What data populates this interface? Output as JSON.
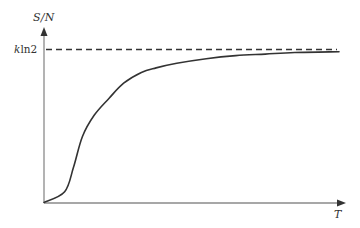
{
  "chart_data": {
    "type": "line",
    "title": "",
    "xlabel": "T",
    "ylabel": "S/N",
    "grid": false,
    "legend": null,
    "x_ticks": [],
    "y_ticks": [],
    "reference_lines": [
      {
        "orientation": "horizontal",
        "style": "dashed",
        "label": "kln2",
        "label_parts": {
          "italic": "k",
          "normal": "ln2"
        },
        "y": 1.0
      }
    ],
    "series": [
      {
        "name": "S/N",
        "style": "solid",
        "note": "sigmoidal rise from 0, asymptotically approaching kln2",
        "x": [
          0.0,
          0.07,
          0.1,
          0.13,
          0.17,
          0.22,
          0.27,
          0.33,
          0.38,
          0.45,
          0.55,
          0.65,
          0.75,
          0.85,
          1.0
        ],
        "y": [
          0.0,
          0.07,
          0.23,
          0.43,
          0.57,
          0.68,
          0.78,
          0.85,
          0.88,
          0.91,
          0.94,
          0.96,
          0.97,
          0.98,
          0.985
        ]
      }
    ],
    "xlim": [
      0,
      1
    ],
    "ylim": [
      0,
      1.15
    ]
  },
  "labels": {
    "y_axis": "S/N",
    "x_axis": "T",
    "ref_k": "k",
    "ref_rest": "ln2"
  },
  "colors": {
    "axis": "#8a8a8a",
    "curve": "#333333",
    "dashed": "#333333"
  }
}
